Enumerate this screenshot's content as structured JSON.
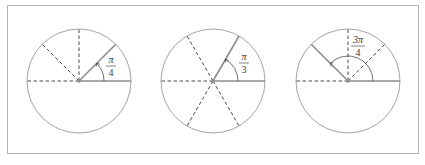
{
  "figure": {
    "panels": [
      {
        "id": "quarter-pi",
        "angle_label_num": "π",
        "angle_label_den": "4",
        "angle_radians_text": "π/4",
        "angle_degrees": 45,
        "dashed_directions_deg": [
          90,
          135,
          180
        ]
      },
      {
        "id": "third-pi",
        "angle_label_num": "π",
        "angle_label_den": "3",
        "angle_radians_text": "π/3",
        "angle_degrees": 60,
        "dashed_directions_deg": [
          120,
          180,
          240,
          300
        ]
      },
      {
        "id": "three-quarter-pi",
        "angle_label_num": "3π",
        "angle_label_den": "4",
        "angle_radians_text": "3π/4",
        "angle_degrees": 135,
        "dashed_directions_deg": [
          45,
          90,
          180
        ]
      }
    ],
    "colors": {
      "circle": "#9a9a9a",
      "solid_ray": "#8c8c8c",
      "dashed_ray": "#333333",
      "frame": "#b4b4b4",
      "text": "#333333"
    }
  }
}
